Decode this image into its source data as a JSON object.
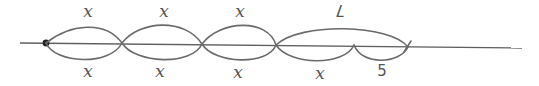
{
  "diagram": {
    "type": "number-line-bar-model",
    "colors": {
      "stroke": "#6a6a6a",
      "text": "#555555",
      "background": "#ffffff"
    },
    "top_labels": [
      {
        "text": "x",
        "x": 88,
        "y": 3
      },
      {
        "text": "x",
        "x": 164,
        "y": 3
      },
      {
        "text": "x",
        "x": 240,
        "y": 3
      },
      {
        "text": "7",
        "x": 340,
        "y": 2
      }
    ],
    "bottom_labels": [
      {
        "text": "x",
        "x": 88,
        "y": 63
      },
      {
        "text": "x",
        "x": 160,
        "y": 63
      },
      {
        "text": "x",
        "x": 238,
        "y": 64
      },
      {
        "text": "x",
        "x": 320,
        "y": 65
      },
      {
        "text": "5",
        "x": 382,
        "y": 64
      }
    ]
  }
}
